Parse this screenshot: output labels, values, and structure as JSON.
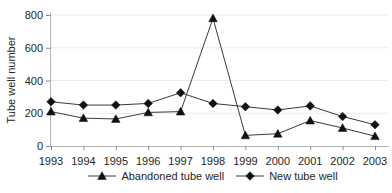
{
  "chart_data": {
    "type": "line",
    "title": "",
    "xlabel": "",
    "ylabel": "Tube well number",
    "ylim": [
      0,
      800
    ],
    "yticks": [
      0,
      200,
      400,
      600,
      800
    ],
    "grid": "horizontal-light",
    "legend_position": "bottom-center",
    "categories": [
      "1993",
      "1994",
      "1995",
      "1996",
      "1997",
      "1998",
      "1999",
      "2000",
      "2001",
      "2002",
      "2003"
    ],
    "series": [
      {
        "name": "Abandoned tube well",
        "marker": "triangle",
        "values": [
          210,
          170,
          165,
          205,
          210,
          780,
          65,
          75,
          155,
          110,
          60
        ]
      },
      {
        "name": "New tube well",
        "marker": "diamond",
        "values": [
          270,
          250,
          250,
          260,
          325,
          260,
          240,
          220,
          245,
          180,
          130
        ]
      }
    ],
    "colors": {
      "line": "#3a3a3a",
      "marker": "#111111",
      "axis": "#b3b3b3",
      "tick": "#8c8c8c",
      "grid": "#ebebeb",
      "text": "#262626",
      "background": "#ffffff"
    }
  }
}
